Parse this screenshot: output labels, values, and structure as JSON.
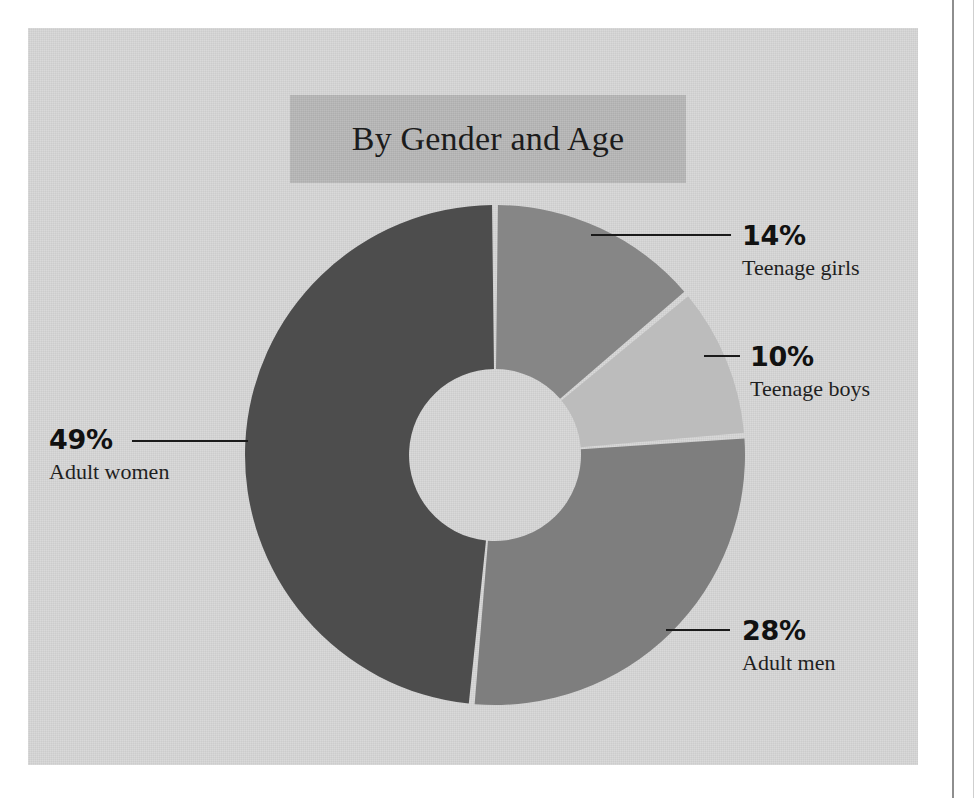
{
  "chart_data": {
    "type": "pie",
    "variant": "donut",
    "title": "By Gender and Age",
    "xlabel": "",
    "ylabel": "",
    "legend_position": "callouts",
    "grid": false,
    "unit": "%",
    "categories": [
      "Adult women",
      "Teenage girls",
      "Teenage boys",
      "Adult men"
    ],
    "values": [
      49,
      14,
      10,
      28
    ],
    "slices": [
      {
        "label": "Adult women",
        "value": 49,
        "display": "49%",
        "color": "#4d4d4d",
        "callout_side": "left"
      },
      {
        "label": "Teenage girls",
        "value": 14,
        "display": "14%",
        "color": "#868686",
        "callout_side": "right"
      },
      {
        "label": "Teenage boys",
        "value": 10,
        "display": "10%",
        "color": "#bcbcbc",
        "callout_side": "right"
      },
      {
        "label": "Adult men",
        "value": 28,
        "display": "28%",
        "color": "#7e7e7e",
        "callout_side": "right"
      }
    ]
  },
  "panel": {
    "background_color": "#d6d6d6",
    "title_band_color": "#b6b6b6"
  },
  "title": {
    "text": "By Gender and Age"
  },
  "callouts": {
    "teenage_girls": {
      "percent": "14%",
      "label": "Teenage girls"
    },
    "teenage_boys": {
      "percent": "10%",
      "label": "Teenage boys"
    },
    "adult_women": {
      "percent": "49%",
      "label": "Adult women"
    },
    "adult_men": {
      "percent": "28%",
      "label": "Adult men"
    }
  }
}
